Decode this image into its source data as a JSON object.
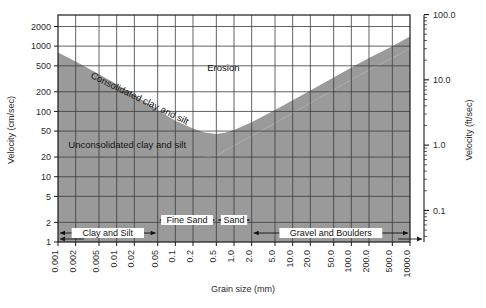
{
  "chart_data": {
    "type": "area",
    "title": "",
    "subtitle": "",
    "xlabel": "Grain size (mm)",
    "ylabel": "Velocity (cm/sec)",
    "y2label": "Velocity (ft/sec)",
    "xscale": "log",
    "yscale": "log",
    "xlim": [
      0.001,
      1000.0
    ],
    "ylim": [
      1,
      3000
    ],
    "y2lim": [
      0.0328,
      98.4
    ],
    "grid": true,
    "legend": "none",
    "xticks": [
      "0.001",
      "0.002",
      "0.005",
      "0.01",
      "0.02",
      "0.05",
      "0.1",
      "0.2",
      "0.5",
      "1.0",
      "2.0",
      "5.0",
      "10.0",
      "20.0",
      "50.0",
      "100.0",
      "200.0",
      "500.0",
      "1000.0"
    ],
    "xtick_values": [
      0.001,
      0.002,
      0.005,
      0.01,
      0.02,
      0.05,
      0.1,
      0.2,
      0.5,
      1.0,
      2.0,
      5.0,
      10.0,
      20.0,
      50.0,
      100.0,
      200.0,
      500.0,
      1000.0
    ],
    "yticks": [
      "2000",
      "1000",
      "500",
      "200",
      "100",
      "50",
      "20",
      "10",
      "5",
      "2",
      "1"
    ],
    "ytick_values": [
      2000,
      1000,
      500,
      200,
      100,
      50,
      20,
      10,
      5,
      2,
      1
    ],
    "y2ticks": [
      "100.0",
      "10.0",
      "1.0",
      "0.1"
    ],
    "y2tick_values": [
      100.0,
      10.0,
      1.0,
      0.1
    ],
    "annotations": [
      {
        "text": "Erosion",
        "x_mm": 0.35,
        "y_cms": 420,
        "rotation": 0
      },
      {
        "text": "Consolidated clay and silt",
        "x_mm": 0.0035,
        "y_cms": 330,
        "rotation": 26
      },
      {
        "text": "Unconsolidated clay and silt",
        "x_mm": 0.0015,
        "y_cms": 28,
        "rotation": 0
      }
    ],
    "categories": [
      {
        "label": "Clay and Silt",
        "from_mm": 0.001,
        "to_mm": 0.05,
        "row": 1
      },
      {
        "label": "Fine Sand",
        "from_mm": 0.05,
        "to_mm": 0.5,
        "row": 0
      },
      {
        "label": "Sand",
        "from_mm": 0.5,
        "to_mm": 2.0,
        "row": 0
      },
      {
        "label": "Gravel and Boulders",
        "from_mm": 2.0,
        "to_mm": 1000.0,
        "row": 1
      }
    ],
    "series": [
      {
        "name": "Critical erosion velocity - upper bound (consolidated)",
        "comment": "Upper edge of the shaded erosion-threshold band",
        "points_mm_cms": [
          [
            0.001,
            800
          ],
          [
            0.002,
            580
          ],
          [
            0.005,
            370
          ],
          [
            0.01,
            260
          ],
          [
            0.02,
            178
          ],
          [
            0.05,
            105
          ],
          [
            0.1,
            72
          ],
          [
            0.2,
            55
          ],
          [
            0.3,
            48
          ],
          [
            0.5,
            45
          ],
          [
            0.7,
            47
          ],
          [
            1.0,
            52
          ],
          [
            2.0,
            68
          ],
          [
            5.0,
            105
          ],
          [
            10.0,
            148
          ],
          [
            20.0,
            210
          ],
          [
            50.0,
            330
          ],
          [
            100.0,
            470
          ],
          [
            200.0,
            660
          ],
          [
            500.0,
            1000
          ],
          [
            1000.0,
            1400
          ]
        ]
      },
      {
        "name": "Critical erosion velocity - lower bound (unconsolidated)",
        "comment": "Lower edge of the shaded erosion-threshold band",
        "points_mm_cms": [
          [
            0.001,
            20
          ],
          [
            0.002,
            20
          ],
          [
            0.005,
            20
          ],
          [
            0.01,
            20
          ],
          [
            0.02,
            20
          ],
          [
            0.05,
            20
          ],
          [
            0.1,
            20
          ],
          [
            0.2,
            20
          ],
          [
            0.3,
            20
          ],
          [
            0.5,
            21
          ],
          [
            0.7,
            25
          ],
          [
            1.0,
            30
          ],
          [
            2.0,
            42
          ],
          [
            5.0,
            66
          ],
          [
            10.0,
            95
          ],
          [
            20.0,
            135
          ],
          [
            50.0,
            215
          ],
          [
            100.0,
            305
          ],
          [
            200.0,
            430
          ],
          [
            500.0,
            660
          ],
          [
            1000.0,
            920
          ]
        ]
      }
    ],
    "colors": {
      "band_fill": "#9a9a9a",
      "lower_fill": "#9a9a9a",
      "grid": "#3b3b3b",
      "frame": "#1a1a1a",
      "background": "#ffffff",
      "text": "#1a1a1a"
    }
  },
  "axes": {
    "x_title": "Grain size (mm)",
    "y_left_title": "Velocity (cm/sec)",
    "y_right_title": "Velocity (ft/sec)"
  },
  "labels": {
    "erosion": "Erosion",
    "consolidated": "Consolidated clay and silt",
    "unconsolidated": "Unconsolidated clay and silt",
    "clay_and_silt": "Clay and Silt",
    "fine_sand": "Fine Sand",
    "sand": "Sand",
    "gravel_and_boulders": "Gravel and Boulders"
  }
}
